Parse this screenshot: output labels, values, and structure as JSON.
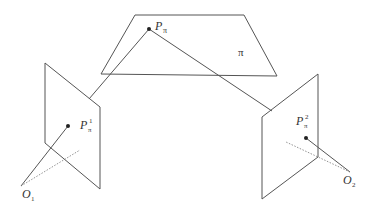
{
  "diagram": {
    "labels": {
      "p_pi": "P",
      "p_pi_sub": "π",
      "plane_pi": "π",
      "p1": "P",
      "p1_sup": "1",
      "p1_sub": "π",
      "p2": "P",
      "p2_sup": "2",
      "p2_sub": "π",
      "o1": "O",
      "o1_sub": "1",
      "o2": "O",
      "o2_sub": "2"
    },
    "colors": {
      "line": "#555555",
      "dotted": "#777777",
      "point": "#222222"
    }
  }
}
